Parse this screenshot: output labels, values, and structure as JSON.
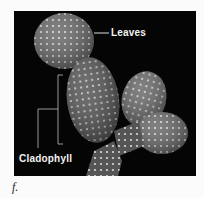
{
  "figure": {
    "labels": {
      "leaves": "Leaves",
      "cladophyll": "Cladophyll"
    },
    "caption": "f."
  }
}
